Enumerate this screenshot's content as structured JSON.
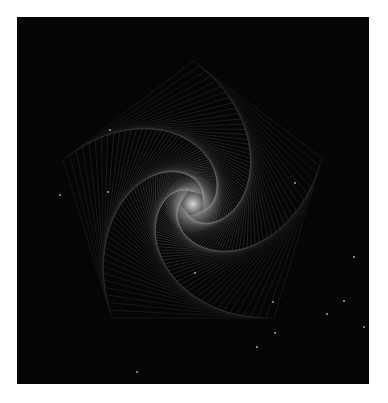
{
  "artwork": {
    "subject": "pentagon whirl spiral",
    "background_color": "#050505",
    "page_background": "#ffffff",
    "frame": {
      "x": 17,
      "y": 17,
      "width": 352,
      "height": 367
    },
    "spiral": {
      "sides": 5,
      "center_x": 176,
      "center_y": 187,
      "outer_vertices": [
        [
          176,
          44
        ],
        [
          305,
          141
        ],
        [
          257,
          301
        ],
        [
          95,
          301
        ],
        [
          46,
          143
        ]
      ],
      "step_fraction": 0.05,
      "iterations": 70,
      "line_color": "#5a5a5a",
      "arm_color": "#7a7a7a",
      "line_width": 0.5
    },
    "center_glow": {
      "color": "#d8d8d8",
      "radius": 28
    },
    "speckles": [
      [
        43,
        178
      ],
      [
        91,
        175
      ],
      [
        93,
        113
      ],
      [
        278,
        166
      ],
      [
        256,
        285
      ],
      [
        258,
        316
      ],
      [
        327,
        284
      ],
      [
        310,
        297
      ],
      [
        337,
        240
      ],
      [
        178,
        256
      ],
      [
        120,
        355
      ],
      [
        240,
        330
      ],
      [
        347,
        310
      ]
    ]
  }
}
